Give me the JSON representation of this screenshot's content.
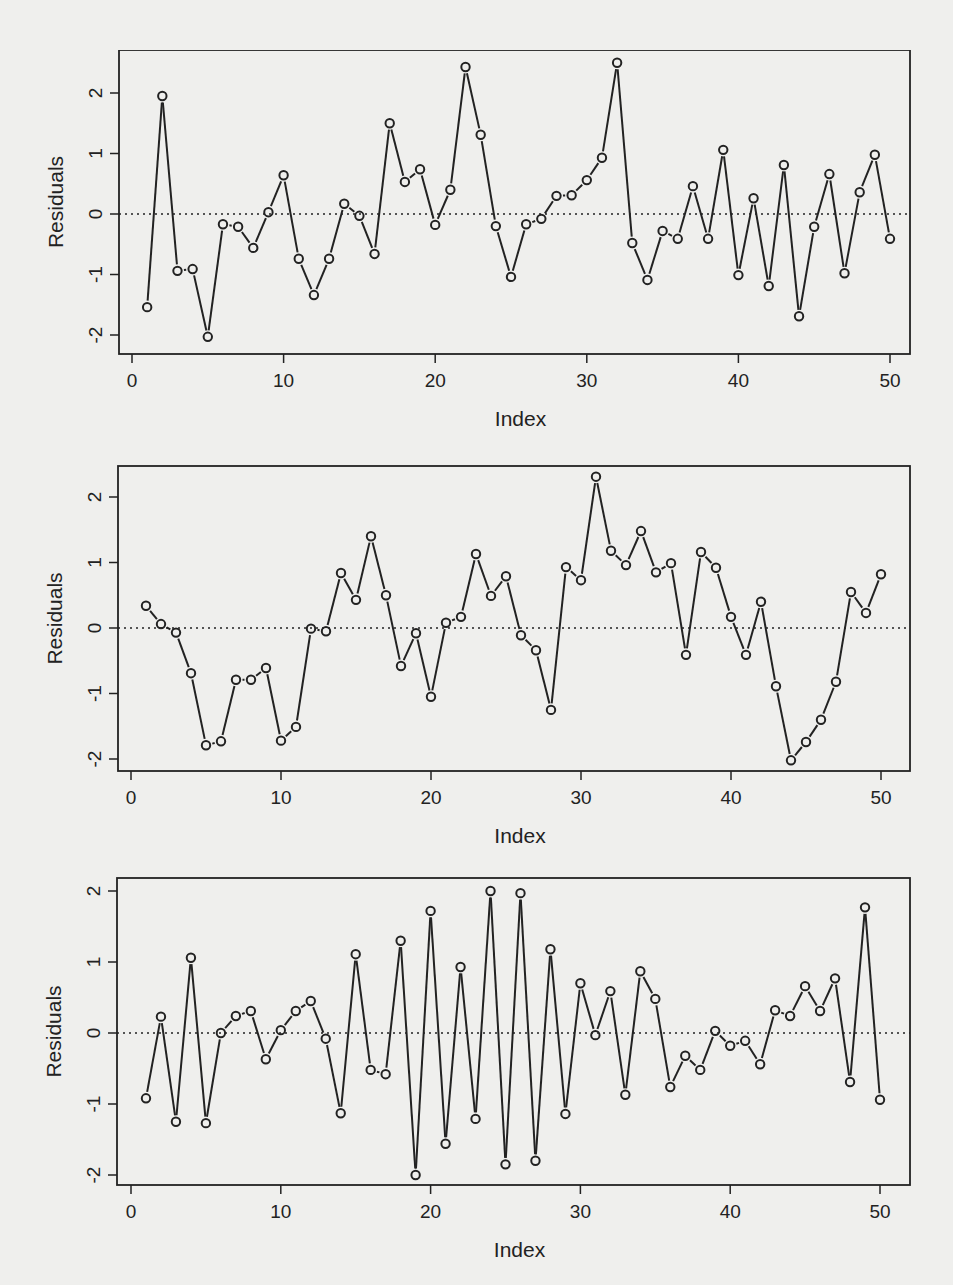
{
  "page": {
    "background": "#efefed",
    "ink": "#222222"
  },
  "chart_data": [
    {
      "type": "line",
      "id": "residuals-plot-1",
      "title": "",
      "xlabel": "Index",
      "ylabel": "Residuals",
      "xlim": [
        0,
        50
      ],
      "ylim": [
        -2,
        2.5
      ],
      "xticks": [
        0,
        10,
        20,
        30,
        40,
        50
      ],
      "xtick_labels": [
        "0",
        "10",
        "20",
        "30",
        "40",
        "50"
      ],
      "yticks": [
        -2,
        -1,
        0,
        1,
        2
      ],
      "ytick_labels": [
        "-2",
        "-1",
        "0",
        "1",
        "2"
      ],
      "reference_line": {
        "y": 0,
        "style": "dotted"
      },
      "markers": "open-circle",
      "grid": false,
      "x": [
        1,
        2,
        3,
        4,
        5,
        6,
        7,
        8,
        9,
        10,
        11,
        12,
        13,
        14,
        15,
        16,
        17,
        18,
        19,
        20,
        21,
        22,
        23,
        24,
        25,
        26,
        27,
        28,
        29,
        30,
        31,
        32,
        33,
        34,
        35,
        36,
        37,
        38,
        39,
        40,
        41,
        42,
        43,
        44,
        45,
        46,
        47,
        48,
        49,
        50
      ],
      "values": [
        -1.54,
        1.95,
        -0.94,
        -0.91,
        -2.03,
        -0.17,
        -0.21,
        -0.56,
        0.03,
        0.64,
        -0.74,
        -1.34,
        -0.74,
        0.17,
        -0.03,
        -0.66,
        1.5,
        0.53,
        0.74,
        -0.18,
        0.4,
        2.43,
        1.31,
        -0.2,
        -1.04,
        -0.17,
        -0.08,
        0.3,
        0.31,
        0.56,
        0.93,
        2.5,
        -0.48,
        -1.09,
        -0.28,
        -0.41,
        0.46,
        -0.41,
        1.06,
        -1.01,
        0.26,
        -1.19,
        0.81,
        -1.69,
        -0.21,
        0.66,
        -0.98,
        0.36,
        0.98,
        -0.41
      ],
      "layout": {
        "top": 50,
        "height": 410,
        "box": [
          119,
          50,
          910,
          354
        ],
        "x0px": 132,
        "xscale": 15.16,
        "y0px": 214,
        "yscale": 60.5
      }
    },
    {
      "type": "line",
      "id": "residuals-plot-2",
      "title": "",
      "xlabel": "Index",
      "ylabel": "Residuals",
      "xlim": [
        0,
        50
      ],
      "ylim": [
        -2.1,
        2.5
      ],
      "xticks": [
        0,
        10,
        20,
        30,
        40,
        50
      ],
      "xtick_labels": [
        "0",
        "10",
        "20",
        "30",
        "40",
        "50"
      ],
      "yticks": [
        -2,
        -1,
        0,
        1,
        2
      ],
      "ytick_labels": [
        "-2",
        "-1",
        "0",
        "1",
        "2"
      ],
      "reference_line": {
        "y": 0,
        "style": "dotted"
      },
      "markers": "open-circle",
      "grid": false,
      "x": [
        1,
        2,
        3,
        4,
        5,
        6,
        7,
        8,
        9,
        10,
        11,
        12,
        13,
        14,
        15,
        16,
        17,
        18,
        19,
        20,
        21,
        22,
        23,
        24,
        25,
        26,
        27,
        28,
        29,
        30,
        31,
        32,
        33,
        34,
        35,
        36,
        37,
        38,
        39,
        40,
        41,
        42,
        43,
        44,
        45,
        46,
        47,
        48,
        49,
        50
      ],
      "values": [
        0.34,
        0.06,
        -0.07,
        -0.69,
        -1.79,
        -1.73,
        -0.79,
        -0.79,
        -0.61,
        -1.72,
        -1.51,
        -0.01,
        -0.05,
        0.84,
        0.43,
        1.4,
        0.5,
        -0.58,
        -0.08,
        -1.05,
        0.08,
        0.17,
        1.13,
        0.49,
        0.79,
        -0.11,
        -0.34,
        -1.25,
        0.93,
        0.73,
        2.31,
        1.18,
        0.96,
        1.48,
        0.85,
        0.99,
        -0.41,
        1.16,
        0.92,
        0.17,
        -0.41,
        0.4,
        -0.89,
        -2.02,
        -1.74,
        -1.4,
        -0.82,
        0.55,
        0.23,
        0.82
      ],
      "layout": {
        "top": 460,
        "height": 410,
        "box": [
          118,
          466,
          910,
          771
        ],
        "x0px": 131,
        "xscale": 15.0,
        "y0px": 628,
        "yscale": 65.5
      }
    },
    {
      "type": "line",
      "id": "residuals-plot-3",
      "title": "",
      "xlabel": "Index",
      "ylabel": "Residuals",
      "xlim": [
        0,
        50
      ],
      "ylim": [
        -2.1,
        2.2
      ],
      "xticks": [
        0,
        10,
        20,
        30,
        40,
        50
      ],
      "xtick_labels": [
        "0",
        "10",
        "20",
        "30",
        "40",
        "50"
      ],
      "yticks": [
        -2,
        -1,
        0,
        1,
        2
      ],
      "ytick_labels": [
        "-2",
        "-1",
        "0",
        "1",
        "2"
      ],
      "reference_line": {
        "y": 0,
        "style": "dotted"
      },
      "markers": "open-circle",
      "grid": false,
      "x": [
        1,
        2,
        3,
        4,
        5,
        6,
        7,
        8,
        9,
        10,
        11,
        12,
        13,
        14,
        15,
        16,
        17,
        18,
        19,
        20,
        21,
        22,
        23,
        24,
        25,
        26,
        27,
        28,
        29,
        30,
        31,
        32,
        33,
        34,
        35,
        36,
        37,
        38,
        39,
        40,
        41,
        42,
        43,
        44,
        45,
        46,
        47,
        48,
        49,
        50
      ],
      "values": [
        -0.92,
        0.23,
        -1.25,
        1.06,
        -1.27,
        0.0,
        0.24,
        0.31,
        -0.37,
        0.04,
        0.31,
        0.45,
        -0.08,
        -1.13,
        1.11,
        -0.52,
        -0.58,
        1.3,
        -2.0,
        1.72,
        -1.56,
        0.93,
        -1.21,
        2.0,
        -1.85,
        1.97,
        -1.8,
        1.18,
        -1.14,
        0.7,
        -0.03,
        0.59,
        -0.87,
        0.87,
        0.48,
        -0.76,
        -0.32,
        -0.52,
        0.03,
        -0.18,
        -0.11,
        -0.44,
        0.32,
        0.24,
        0.66,
        0.31,
        0.77,
        -0.69,
        1.77,
        -0.94
      ],
      "layout": {
        "top": 870,
        "height": 415,
        "box": [
          117,
          878,
          910,
          1185
        ],
        "x0px": 131,
        "xscale": 14.98,
        "y0px": 1033,
        "yscale": 71
      }
    }
  ]
}
